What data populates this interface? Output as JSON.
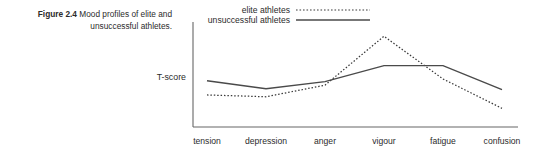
{
  "caption": {
    "figure_number": "Figure 2.4",
    "text": " Mood profiles of elite and unsuccessful athletes."
  },
  "axis": {
    "ylabel": "T-score"
  },
  "legend": {
    "items": [
      {
        "label": "elite athletes",
        "style": "dotted"
      },
      {
        "label": "unsuccessful athletes",
        "style": "solid"
      }
    ]
  },
  "chart_data": {
    "type": "line",
    "title": "Mood profiles of elite and unsuccessful athletes",
    "xlabel": "",
    "ylabel": "T-score",
    "categories": [
      "tension",
      "depression",
      "anger",
      "vigour",
      "fatigue",
      "confusion"
    ],
    "grid": false,
    "legend_position": "top-right",
    "axis_ranges": {
      "x": [
        0,
        5
      ],
      "y": [
        0,
        100
      ]
    },
    "series": [
      {
        "name": "elite athletes",
        "style": "dotted",
        "color": "#3a3a3a",
        "values": [
          27,
          25,
          38,
          93,
          45,
          12
        ]
      },
      {
        "name": "unsuccessful athletes",
        "style": "solid",
        "color": "#4a4a4a",
        "values": [
          43,
          34,
          42,
          60,
          60,
          33
        ]
      }
    ]
  },
  "geometry": {
    "plot": {
      "left": 193,
      "right": 518,
      "top": 22,
      "bottom": 127
    },
    "legend_swatches": {
      "elite": {
        "x1": 296,
        "x2": 370,
        "y": 10
      },
      "unsuccessful": {
        "x1": 296,
        "x2": 370,
        "y": 20
      }
    }
  }
}
